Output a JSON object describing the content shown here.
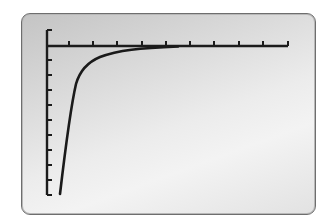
{
  "device": {
    "type": "graphing-calculator-screen",
    "frame_color": "#6e6e6e",
    "background_gradient": [
      "#c4c4c4",
      "#f3f3f3",
      "#e2e2e2"
    ]
  },
  "chart_data": {
    "type": "line",
    "title": "",
    "xlabel": "",
    "ylabel": "",
    "grid": false,
    "legend": null,
    "axes": {
      "x_axis_position": "top",
      "x_tick_count": 10,
      "y_tick_count": 11,
      "x_ticks_px": [
        69,
        93,
        117,
        142,
        166,
        190,
        214,
        239,
        263,
        288
      ],
      "y_ticks_px": [
        30,
        60,
        75,
        90,
        105,
        120,
        135,
        150,
        165,
        180,
        195
      ]
    },
    "xlim": [
      0,
      10
    ],
    "ylim": [
      -11,
      1
    ],
    "series": [
      {
        "name": "curve",
        "color": "#1a1a1a",
        "description": "Steeply increasing curve approaching the x-axis asymptotically from below (e.g. y = -k/x)",
        "x": [
          0.55,
          0.7,
          0.9,
          1.2,
          1.6,
          2.2,
          3.0,
          4.0,
          5.3
        ],
        "y": [
          -10.0,
          -8.2,
          -6.1,
          -4.6,
          -3.1,
          -2.0,
          -1.2,
          -0.6,
          -0.15
        ]
      }
    ]
  },
  "plot_px": {
    "y_axis_x": 47,
    "x_axis_y": 46,
    "y_axis_top": 30,
    "y_axis_bottom": 195,
    "x_axis_right": 288,
    "curve_path": "M60,194 C64,160 70,110 76,84 C80,70 88,62 100,57 C118,50 140,48 178,46.5"
  }
}
